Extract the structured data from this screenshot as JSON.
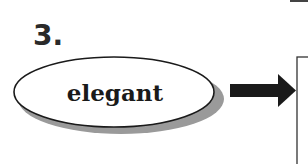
{
  "diagram": {
    "step_number": "3.",
    "word": "elegant",
    "colors": {
      "ink": "#1a1a1a",
      "shadow": "#9a9a9a",
      "fill": "#ffffff"
    },
    "arrow": {
      "direction": "right"
    }
  }
}
